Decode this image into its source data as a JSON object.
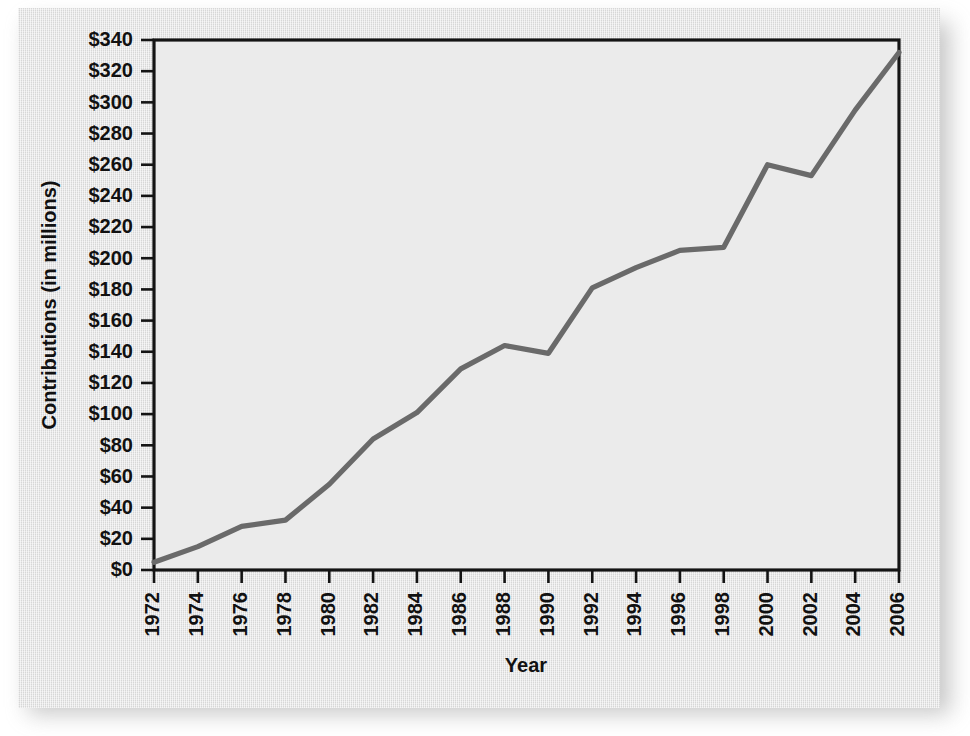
{
  "chart_data": {
    "type": "line",
    "title": "",
    "xlabel": "Year",
    "ylabel": "Contributions (in millions)",
    "x": [
      1972,
      1974,
      1976,
      1978,
      1980,
      1982,
      1984,
      1986,
      1988,
      1990,
      1992,
      1994,
      1996,
      1998,
      2000,
      2002,
      2004,
      2006
    ],
    "values": [
      5,
      15,
      28,
      32,
      55,
      84,
      101,
      129,
      144,
      139,
      181,
      194,
      205,
      207,
      260,
      253,
      295,
      332
    ],
    "series": [
      {
        "name": "Contributions",
        "values": [
          5,
          15,
          28,
          32,
          55,
          84,
          101,
          129,
          144,
          139,
          181,
          194,
          205,
          207,
          260,
          253,
          295,
          332
        ]
      }
    ],
    "xtick_labels": [
      "1972",
      "1974",
      "1976",
      "1978",
      "1980",
      "1982",
      "1984",
      "1986",
      "1988",
      "1990",
      "1992",
      "1994",
      "1996",
      "1998",
      "2000",
      "2002",
      "2004",
      "2006"
    ],
    "ytick_values": [
      0,
      20,
      40,
      60,
      80,
      100,
      120,
      140,
      160,
      180,
      200,
      220,
      240,
      260,
      280,
      300,
      320,
      340
    ],
    "ytick_labels": [
      "$0",
      "$20",
      "$40",
      "$60",
      "$80",
      "$100",
      "$120",
      "$140",
      "$160",
      "$180",
      "$200",
      "$220",
      "$240",
      "$260",
      "$280",
      "$300",
      "$320",
      "$340"
    ],
    "xlim": [
      1972,
      2006
    ],
    "ylim": [
      0,
      340
    ],
    "grid": false,
    "legend": false,
    "legend_position": "none",
    "line_color": "#6a6a6a",
    "plot_background": "#ebebeb",
    "card_background": "#e2e2e2",
    "axis_color": "#141414"
  }
}
